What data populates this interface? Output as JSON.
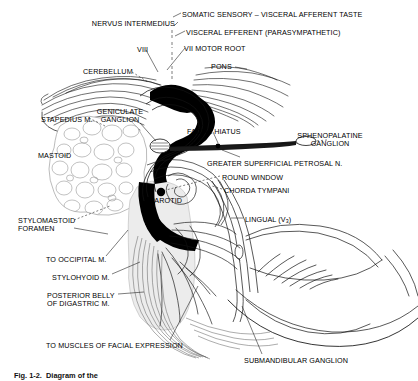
{
  "figure": {
    "caption": "Fig. 1-2.  Diagram of the",
    "background_color": "#ffffff",
    "ink_color": "#000000",
    "tissue_fill_color": "#ebebeb",
    "nerve_fill_color": "#000000"
  },
  "labels": [
    {
      "id": "somatic-sensory",
      "text": "SOMATIC SENSORY – VISCERAL AFFERENT TASTE",
      "x": 182,
      "y": 11,
      "align": "left"
    },
    {
      "id": "nervus-intermedius",
      "text": "NERVUS INTERMEDIUS",
      "x": 175,
      "y": 20,
      "align": "right"
    },
    {
      "id": "visceral-efferent",
      "text": "VISCERAL EFFERENT (PARASYMPATHETIC)",
      "x": 186,
      "y": 29,
      "align": "left"
    },
    {
      "id": "vii-motor-root",
      "text": "VII MOTOR ROOT",
      "x": 184,
      "y": 45,
      "align": "left"
    },
    {
      "id": "viii",
      "text": "VIII",
      "x": 137,
      "y": 46,
      "align": "left"
    },
    {
      "id": "pons",
      "text": "PONS",
      "x": 211,
      "y": 63,
      "align": "left"
    },
    {
      "id": "cerebellum",
      "text": "CEREBELLUM",
      "x": 83,
      "y": 68,
      "align": "left"
    },
    {
      "id": "stapedius-m",
      "text": "STAPEDIUS M.",
      "x": 41,
      "y": 116,
      "align": "left"
    },
    {
      "id": "geniculate-ganglion",
      "text": "GENICULATE\nGANGLION",
      "x": 120,
      "y": 108,
      "align": "center"
    },
    {
      "id": "facial-hiatus",
      "text": "FACIAL HIATUS",
      "x": 187,
      "y": 128,
      "align": "left"
    },
    {
      "id": "sphenopalatine-ganglion",
      "text": "SPHENOPALATINE\nGANGLION",
      "x": 330,
      "y": 132,
      "align": "center"
    },
    {
      "id": "mastoid",
      "text": "MASTOID",
      "x": 38,
      "y": 152,
      "align": "left"
    },
    {
      "id": "greater-superficial-petrosal-n",
      "text": "GREATER SUPERFICIAL PETROSAL N.",
      "x": 207,
      "y": 160,
      "align": "left"
    },
    {
      "id": "round-window",
      "text": "ROUND WINDOW",
      "x": 222,
      "y": 174,
      "align": "left"
    },
    {
      "id": "chorda-tympani",
      "text": "CHORDA TYMPANI",
      "x": 224,
      "y": 187,
      "align": "left"
    },
    {
      "id": "parotid",
      "text": "PAROTID",
      "x": 150,
      "y": 197,
      "align": "left"
    },
    {
      "id": "lingual-v3",
      "text": "LINGUAL (V<sub>3</sub>)",
      "x": 245,
      "y": 216,
      "align": "left",
      "html": true
    },
    {
      "id": "stylomastoid-foramen",
      "text": "STYLOMASTOID\nFORAMEN",
      "x": 18,
      "y": 217,
      "align": "left"
    },
    {
      "id": "to-occipital-m",
      "text": "TO OCCIPITAL M.",
      "x": 46,
      "y": 256,
      "align": "left"
    },
    {
      "id": "stylohyoid-m",
      "text": "STYLOHYOID M.",
      "x": 52,
      "y": 274,
      "align": "left"
    },
    {
      "id": "posterior-belly-digastric",
      "text": "POSTERIOR BELLY\nOF DIGASTRIC M.",
      "x": 47,
      "y": 292,
      "align": "left"
    },
    {
      "id": "to-muscles-facial-expression",
      "text": "TO MUSCLES OF FACIAL EXPRESSION",
      "x": 46,
      "y": 342,
      "align": "left"
    },
    {
      "id": "submandibular-ganglion",
      "text": "SUBMANDIBULAR GANGLION",
      "x": 244,
      "y": 357,
      "align": "left"
    }
  ],
  "structures": [
    {
      "id": "brainstem-pons",
      "name": "pons"
    },
    {
      "id": "cerebellum",
      "name": "cerebellum"
    },
    {
      "id": "facial-nerve-trunk",
      "name": "facial nerve trunk"
    },
    {
      "id": "geniculate-ganglion",
      "name": "geniculate ganglion"
    },
    {
      "id": "mastoid-air-cells",
      "name": "mastoid air cells"
    },
    {
      "id": "parotid-gland",
      "name": "parotid gland"
    },
    {
      "id": "mandible",
      "name": "mandible"
    },
    {
      "id": "tongue",
      "name": "tongue"
    },
    {
      "id": "round-window",
      "name": "round window"
    },
    {
      "id": "sphenopalatine-ganglion",
      "name": "sphenopalatine ganglion"
    },
    {
      "id": "submandibular-ganglion",
      "name": "submandibular ganglion"
    },
    {
      "id": "facial-muscle-branches",
      "name": "facial expression muscle branches"
    }
  ]
}
